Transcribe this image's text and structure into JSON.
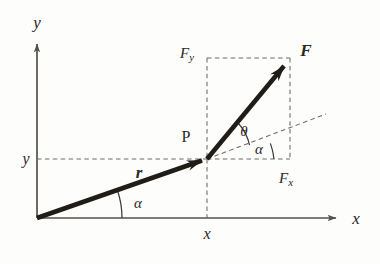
{
  "figure": {
    "colors": {
      "axis": "#55504a",
      "vector": "#201c18",
      "dashed": "#6f6a64",
      "arc": "#3a3632",
      "background": "#fdfdfc",
      "text": "#2b2724"
    },
    "axes": {
      "x_axis_label": "x",
      "y_axis_label": "y",
      "origin_x": 37,
      "origin_y": 218,
      "x_axis_end": 340,
      "y_axis_top": 40
    },
    "labels": {
      "y_tick": "y",
      "x_tick": "x",
      "point_p": "P",
      "r_vector": "r",
      "f_vector": "F",
      "f_x": {
        "base": "F",
        "sub": "x"
      },
      "f_y": {
        "base": "F",
        "sub": "y"
      },
      "angle_alpha_origin": "α",
      "angle_alpha_p": "α",
      "angle_theta": "θ"
    },
    "geometry": {
      "point_p": {
        "x": 207,
        "y": 159
      },
      "f_tip": {
        "x": 288,
        "y": 61
      },
      "box": {
        "left": 207,
        "top": 58,
        "right": 290,
        "bottom": 159
      },
      "dashed_extension_end": {
        "x": 326,
        "y": 114
      },
      "alpha_origin_deg": 19,
      "theta_deg": 31,
      "alpha_p_deg": 19
    }
  }
}
